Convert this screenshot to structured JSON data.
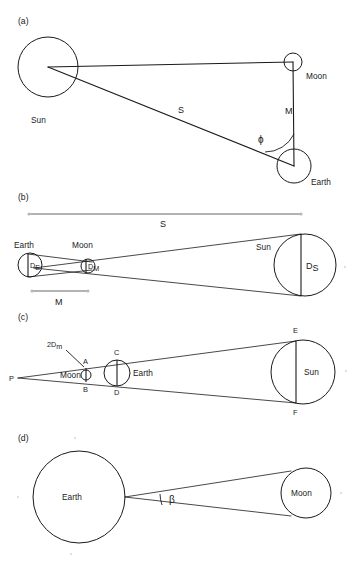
{
  "figure": {
    "background_color": "#ffffff",
    "line_color": "#1a1a1a",
    "width": 354,
    "height": 570
  },
  "panels": [
    {
      "id": "a",
      "label": "(a)",
      "description": "Sun-Earth-Moon right triangle at quarter moon",
      "bodies": [
        {
          "name": "Sun",
          "label": "Sun"
        },
        {
          "name": "Moon",
          "label": "Moon"
        },
        {
          "name": "Earth",
          "label": "Earth"
        }
      ],
      "segments": [
        {
          "name": "sun-moon",
          "label": ""
        },
        {
          "name": "sun-earth",
          "label": "S"
        },
        {
          "name": "earth-moon",
          "label": "M"
        }
      ],
      "angles": [
        {
          "name": "phi",
          "label": "ϕ",
          "vertex": "Earth"
        }
      ]
    },
    {
      "id": "b",
      "label": "(b)",
      "description": "Solar eclipse cone: Earth and Moon diameters subtending the Sun diameter",
      "bodies": [
        {
          "name": "Earth",
          "label": "Earth"
        },
        {
          "name": "Moon",
          "label": "Moon"
        },
        {
          "name": "Sun",
          "label": "Sun"
        }
      ],
      "diameters": [
        {
          "name": "earth-diameter",
          "label": "D",
          "subscript": "E"
        },
        {
          "name": "moon-diameter",
          "label": "D",
          "subscript": "M"
        },
        {
          "name": "sun-diameter",
          "label": "D",
          "subscript": "S"
        }
      ],
      "dimensions": [
        {
          "name": "sun-distance",
          "label": "S"
        },
        {
          "name": "moon-distance",
          "label": "M"
        }
      ]
    },
    {
      "id": "c",
      "label": "(c)",
      "description": "Shadow cone from apex P through Moon and Earth to the Sun",
      "bodies": [
        {
          "name": "Moon",
          "label": "Moon"
        },
        {
          "name": "Earth",
          "label": "Earth"
        },
        {
          "name": "Sun",
          "label": "Sun"
        }
      ],
      "points": [
        {
          "name": "point-p",
          "label": "P"
        },
        {
          "name": "point-a",
          "label": "A"
        },
        {
          "name": "point-b",
          "label": "B"
        },
        {
          "name": "point-c",
          "label": "C"
        },
        {
          "name": "point-d",
          "label": "D"
        },
        {
          "name": "point-e",
          "label": "E"
        },
        {
          "name": "point-f",
          "label": "F"
        }
      ],
      "annotations": [
        {
          "name": "two-dm-label",
          "label": "2D",
          "subscript": "m"
        }
      ]
    },
    {
      "id": "d",
      "label": "(d)",
      "description": "Angular size beta of the Moon as seen from the Earth",
      "bodies": [
        {
          "name": "Earth",
          "label": "Earth"
        },
        {
          "name": "Moon",
          "label": "Moon"
        }
      ],
      "angles": [
        {
          "name": "beta",
          "label": "β",
          "vertex": "Earth"
        }
      ]
    }
  ]
}
